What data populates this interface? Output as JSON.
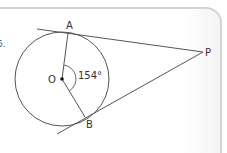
{
  "question": {
    "number_fragment": "6."
  },
  "diagram": {
    "points": {
      "A": {
        "label": "A"
      },
      "B": {
        "label": "B"
      },
      "P": {
        "label": "P"
      },
      "O": {
        "label": "O"
      }
    },
    "angle_label": "154°"
  }
}
